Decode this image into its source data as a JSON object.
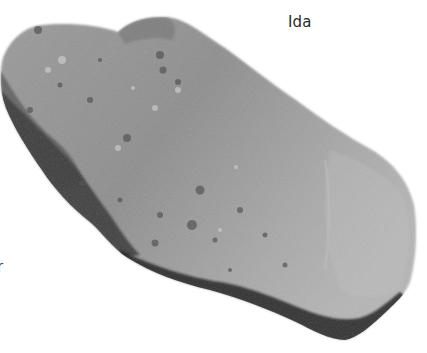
{
  "image": {
    "subject": "asteroid",
    "description": "Grayscale photograph of an elongated, cratered asteroid on a white background",
    "background_color": "#ffffff",
    "surface_color": "#8f8f8f",
    "shadow_color": "#1e1e1e"
  },
  "labels": {
    "name": "Ida",
    "left_edge_fragment": "r"
  }
}
